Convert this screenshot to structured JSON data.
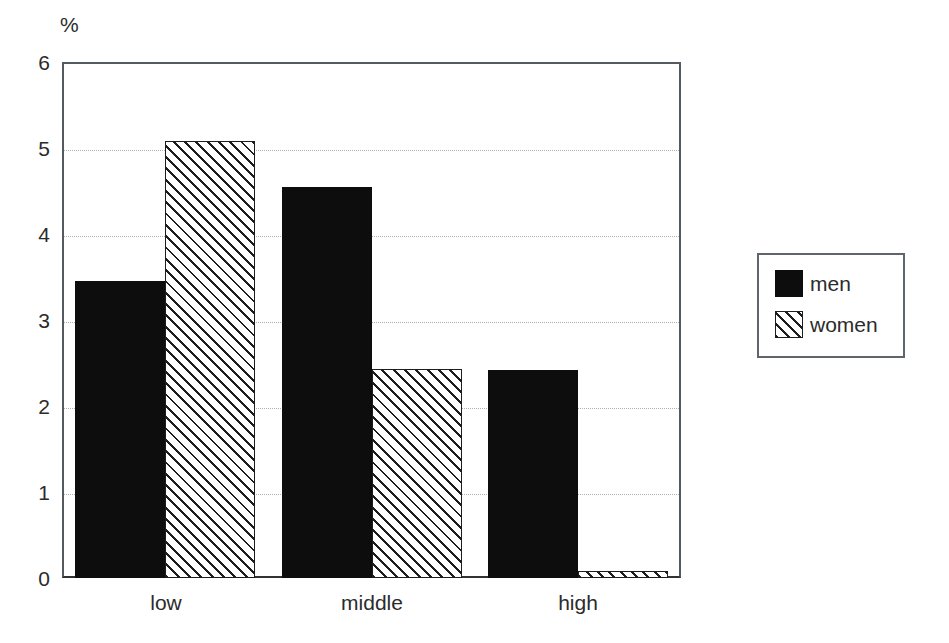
{
  "chart_data": {
    "type": "bar",
    "title": "",
    "subtitle": "",
    "xlabel": "",
    "ylabel": "%",
    "unit_label": "%",
    "categories": [
      "low",
      "middle",
      "high"
    ],
    "series": [
      {
        "name": "men",
        "values": [
          3.45,
          4.55,
          2.42
        ],
        "style": "solid-black",
        "color": "#0d0d0d"
      },
      {
        "name": "women",
        "values": [
          5.08,
          2.43,
          0.08
        ],
        "style": "diagonal-hatch",
        "color": "#1d1d1d"
      }
    ],
    "ylim": [
      0,
      6
    ],
    "yticks": [
      0,
      1,
      2,
      3,
      4,
      5,
      6
    ],
    "ytick_labels": [
      "0",
      "1",
      "2",
      "3",
      "4",
      "5",
      "6"
    ],
    "grid": true,
    "grid_axis": "y",
    "grid_style": "dotted",
    "grid_color": "#aeb2b8",
    "legend_position": "right-outside",
    "axis_color": "#555a60",
    "background": "#ffffff"
  },
  "legend": {
    "entries": [
      {
        "label": "men"
      },
      {
        "label": "women"
      }
    ]
  },
  "axes": {
    "y_unit": "%",
    "y_ticks": [
      "6",
      "5",
      "4",
      "3",
      "2",
      "1",
      "0"
    ],
    "x_ticks": [
      "low",
      "middle",
      "high"
    ]
  }
}
